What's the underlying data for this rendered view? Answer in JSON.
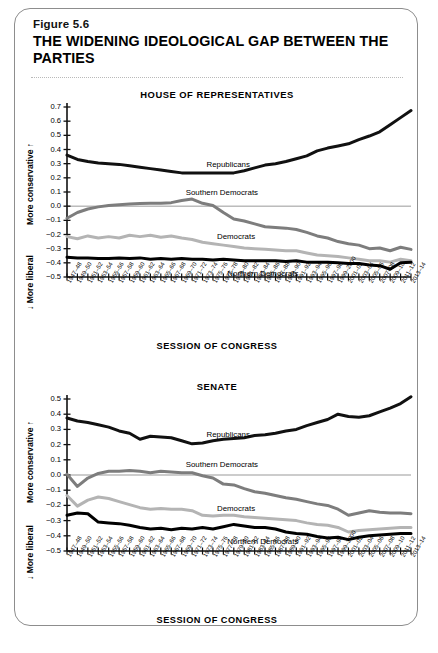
{
  "figure": {
    "number": "Figure 5.6",
    "title": "THE WIDENING IDEOLOGICAL GAP BETWEEN THE PARTIES"
  },
  "axis_titles": {
    "x_caption": "SESSION OF CONGRESS",
    "y_upper": "More conservative",
    "y_lower": "More liberal",
    "y_upper_arrow": "↑",
    "y_lower_arrow": "↓"
  },
  "colors": {
    "republicans": "#111111",
    "southern_democrats": "#7d7d7d",
    "democrats": "#b4b4b4",
    "northern_democrats": "#000000",
    "zero_line": "#6f6f6f",
    "axis": "#111111",
    "card_border": "#8d8d8d"
  },
  "sessions": [
    "1947–48",
    "1949–50",
    "1951–52",
    "1953–54",
    "1955–56",
    "1957–58",
    "1959–60",
    "1961–62",
    "1963–64",
    "1965–66",
    "1967–68",
    "1969–70",
    "1971–72",
    "1973–74",
    "1975–76",
    "1977–78",
    "1979–80",
    "1981–82",
    "1983–84",
    "1985–86",
    "1987–88",
    "1989–90",
    "1991–92",
    "1993–94",
    "1995–96",
    "1997–98",
    "1999–2000",
    "2001–02",
    "2003–04",
    "2005–06",
    "2007–08",
    "2009–10",
    "2011–12",
    "2013–14"
  ],
  "chart_data": [
    {
      "type": "line",
      "title": "HOUSE OF REPRESENTATIVES",
      "xlabel": "SESSION OF CONGRESS",
      "ylabel": "More conservative / More liberal",
      "ylim": [
        -0.5,
        0.7
      ],
      "yticks": [
        0.7,
        0.6,
        0.5,
        0.4,
        0.3,
        0.2,
        0.1,
        0.0,
        -0.1,
        -0.2,
        -0.3,
        -0.4,
        -0.5
      ],
      "ytick_labels": [
        "0.7",
        "0.6",
        "0.5",
        "0.4",
        "0.3",
        "0.2",
        "0.1",
        "0.0",
        "−0.1",
        "−0.2",
        "−0.3",
        "−0.4",
        "−0.5"
      ],
      "grid": false,
      "legend": "inline-labels",
      "x": [
        "1947–48",
        "1949–50",
        "1951–52",
        "1953–54",
        "1955–56",
        "1957–58",
        "1959–60",
        "1961–62",
        "1963–64",
        "1965–66",
        "1967–68",
        "1969–70",
        "1971–72",
        "1973–74",
        "1975–76",
        "1977–78",
        "1979–80",
        "1981–82",
        "1983–84",
        "1985–86",
        "1987–88",
        "1989–90",
        "1991–92",
        "1993–94",
        "1995–96",
        "1997–98",
        "1999–2000",
        "2001–02",
        "2003–04",
        "2005–06",
        "2007–08",
        "2009–10",
        "2011–12",
        "2013–14"
      ],
      "series": [
        {
          "name": "Republicans",
          "color": "#111111",
          "width": 3.0,
          "label_at": 13,
          "values": [
            0.36,
            0.33,
            0.315,
            0.305,
            0.3,
            0.295,
            0.285,
            0.275,
            0.265,
            0.255,
            0.245,
            0.235,
            0.235,
            0.235,
            0.235,
            0.235,
            0.235,
            0.25,
            0.27,
            0.29,
            0.3,
            0.315,
            0.335,
            0.355,
            0.39,
            0.41,
            0.425,
            0.44,
            0.47,
            0.495,
            0.525,
            0.575,
            0.625,
            0.675
          ]
        },
        {
          "name": "Southern Democrats",
          "color": "#7d7d7d",
          "width": 3.0,
          "label_at": 11,
          "values": [
            -0.085,
            -0.045,
            -0.02,
            -0.005,
            0.005,
            0.01,
            0.015,
            0.018,
            0.02,
            0.02,
            0.025,
            0.04,
            0.05,
            0.02,
            0.005,
            -0.045,
            -0.09,
            -0.105,
            -0.125,
            -0.145,
            -0.15,
            -0.155,
            -0.165,
            -0.185,
            -0.21,
            -0.225,
            -0.25,
            -0.265,
            -0.275,
            -0.3,
            -0.295,
            -0.315,
            -0.29,
            -0.305
          ]
        },
        {
          "name": "Democrats",
          "color": "#b4b4b4",
          "width": 3.0,
          "label_at": 14,
          "values": [
            -0.215,
            -0.23,
            -0.21,
            -0.225,
            -0.215,
            -0.225,
            -0.205,
            -0.215,
            -0.205,
            -0.22,
            -0.21,
            -0.225,
            -0.235,
            -0.255,
            -0.265,
            -0.275,
            -0.285,
            -0.295,
            -0.3,
            -0.305,
            -0.31,
            -0.315,
            -0.315,
            -0.33,
            -0.345,
            -0.35,
            -0.355,
            -0.365,
            -0.375,
            -0.385,
            -0.385,
            -0.395,
            -0.375,
            -0.385
          ]
        },
        {
          "name": "Northern Democrats",
          "color": "#000000",
          "width": 3.0,
          "label_at": 15,
          "values": [
            -0.36,
            -0.365,
            -0.365,
            -0.37,
            -0.37,
            -0.365,
            -0.37,
            -0.365,
            -0.375,
            -0.37,
            -0.375,
            -0.37,
            -0.375,
            -0.375,
            -0.38,
            -0.375,
            -0.38,
            -0.385,
            -0.385,
            -0.385,
            -0.385,
            -0.39,
            -0.385,
            -0.395,
            -0.395,
            -0.395,
            -0.4,
            -0.405,
            -0.405,
            -0.415,
            -0.42,
            -0.445,
            -0.4,
            -0.395
          ]
        }
      ]
    },
    {
      "type": "line",
      "title": "SENATE",
      "xlabel": "SESSION OF CONGRESS",
      "ylabel": "More conservative / More liberal",
      "ylim": [
        -0.5,
        0.5
      ],
      "yticks": [
        0.5,
        0.4,
        0.3,
        0.2,
        0.1,
        0.0,
        -0.1,
        -0.2,
        -0.3,
        -0.4,
        -0.5
      ],
      "ytick_labels": [
        "0.5",
        "0.4",
        "0.3",
        "0.2",
        "0.1",
        "0.0",
        "−0.1",
        "−0.2",
        "−0.3",
        "−0.4",
        "−0.5"
      ],
      "grid": false,
      "legend": "inline-labels",
      "x": [
        "1947–48",
        "1949–50",
        "1951–52",
        "1953–54",
        "1955–56",
        "1957–58",
        "1959–60",
        "1961–62",
        "1963–64",
        "1965–66",
        "1967–68",
        "1969–70",
        "1971–72",
        "1973–74",
        "1975–76",
        "1977–78",
        "1979–80",
        "1981–82",
        "1983–84",
        "1985–86",
        "1987–88",
        "1989–90",
        "1991–92",
        "1993–94",
        "1995–96",
        "1997–98",
        "1999–2000",
        "2001–02",
        "2003–04",
        "2005–06",
        "2007–08",
        "2009–10",
        "2011–12",
        "2013–14"
      ],
      "series": [
        {
          "name": "Republicans",
          "color": "#111111",
          "width": 3.0,
          "label_at": 13,
          "values": [
            0.375,
            0.355,
            0.345,
            0.33,
            0.315,
            0.29,
            0.275,
            0.235,
            0.255,
            0.25,
            0.245,
            0.225,
            0.205,
            0.21,
            0.225,
            0.235,
            0.24,
            0.245,
            0.26,
            0.265,
            0.275,
            0.29,
            0.3,
            0.325,
            0.345,
            0.365,
            0.4,
            0.385,
            0.38,
            0.39,
            0.415,
            0.44,
            0.47,
            0.515
          ]
        },
        {
          "name": "Southern Democrats",
          "color": "#7d7d7d",
          "width": 3.0,
          "label_at": 11,
          "values": [
            0.005,
            -0.075,
            -0.02,
            0.01,
            0.025,
            0.025,
            0.03,
            0.025,
            0.015,
            0.025,
            0.02,
            0.015,
            0.015,
            -0.005,
            -0.02,
            -0.06,
            -0.065,
            -0.09,
            -0.11,
            -0.12,
            -0.135,
            -0.15,
            -0.16,
            -0.175,
            -0.19,
            -0.2,
            -0.225,
            -0.265,
            -0.25,
            -0.235,
            -0.245,
            -0.25,
            -0.25,
            -0.255
          ]
        },
        {
          "name": "Democrats",
          "color": "#b4b4b4",
          "width": 3.0,
          "label_at": 14,
          "values": [
            -0.135,
            -0.205,
            -0.165,
            -0.145,
            -0.155,
            -0.175,
            -0.195,
            -0.215,
            -0.225,
            -0.22,
            -0.225,
            -0.225,
            -0.235,
            -0.265,
            -0.27,
            -0.265,
            -0.265,
            -0.275,
            -0.28,
            -0.285,
            -0.29,
            -0.295,
            -0.3,
            -0.315,
            -0.325,
            -0.33,
            -0.345,
            -0.375,
            -0.365,
            -0.36,
            -0.355,
            -0.35,
            -0.345,
            -0.345
          ]
        },
        {
          "name": "Northern Democrats",
          "color": "#000000",
          "width": 3.0,
          "label_at": 15,
          "values": [
            -0.265,
            -0.25,
            -0.255,
            -0.31,
            -0.315,
            -0.32,
            -0.33,
            -0.345,
            -0.355,
            -0.35,
            -0.36,
            -0.35,
            -0.355,
            -0.345,
            -0.355,
            -0.34,
            -0.325,
            -0.335,
            -0.345,
            -0.345,
            -0.355,
            -0.375,
            -0.385,
            -0.39,
            -0.405,
            -0.415,
            -0.41,
            -0.425,
            -0.41,
            -0.4,
            -0.395,
            -0.39,
            -0.385,
            -0.385
          ]
        }
      ]
    }
  ]
}
